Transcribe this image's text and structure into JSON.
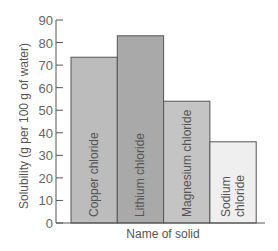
{
  "chart_data": {
    "type": "bar",
    "title": "",
    "xlabel": "Name of solid",
    "ylabel": "Solubility (g per 100 g of water)",
    "categories": [
      "Copper chloride",
      "Lithium chloride",
      "Magnesium chloride",
      "Sodium chloride"
    ],
    "category_lines": [
      [
        "Copper chloride"
      ],
      [
        "Lithium chloride"
      ],
      [
        "Magnesium chloride"
      ],
      [
        "Sodium",
        "chloride"
      ]
    ],
    "values": [
      73.5,
      83,
      54,
      36
    ],
    "ylim": [
      0,
      90
    ],
    "yticks": [
      0,
      10,
      20,
      30,
      40,
      50,
      60,
      70,
      80,
      90
    ],
    "grid": false,
    "legend": null,
    "bar_colors": [
      "#bcbcbc",
      "#a9a9a9",
      "#c4c4c4",
      "#efefef"
    ],
    "edge_color": "#555555"
  }
}
